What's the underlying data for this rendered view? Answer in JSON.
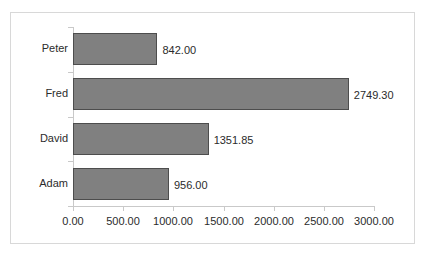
{
  "chart_data": {
    "type": "bar",
    "orientation": "horizontal",
    "title": "",
    "xlabel": "",
    "ylabel": "",
    "categories": [
      "Peter",
      "Fred",
      "David",
      "Adam"
    ],
    "values": [
      842.0,
      2749.3,
      1351.85,
      956.0
    ],
    "value_labels": [
      "842.00",
      "2749.30",
      "1351.85",
      "956.00"
    ],
    "xlim": [
      0,
      3000
    ],
    "xticks": [
      0,
      500,
      1000,
      1500,
      2000,
      2500,
      3000
    ],
    "xtick_labels": [
      "0.00",
      "500.00",
      "1000.00",
      "1500.00",
      "2000.00",
      "2500.00",
      "3000.00"
    ],
    "grid": false,
    "legend": false,
    "bar_color": "#808080",
    "bar_border_color": "#4d4d4d",
    "axis_color": "#c9c9c9",
    "text_color": "#2b2b2b",
    "frame_color": "#d8d8d8",
    "background_color": "#ffffff"
  }
}
